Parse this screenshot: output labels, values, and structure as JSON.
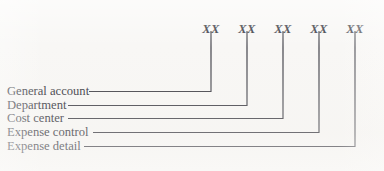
{
  "figure": {
    "kind": "account-code-structure-diagram",
    "background_color": "#f8f7f5",
    "line_color": "#3a3a42",
    "text_color": "#2f2f38",
    "width": 384,
    "height": 171
  },
  "code_blocks": [
    {
      "id": "general-account",
      "text": "XX",
      "x": 211,
      "y": 22
    },
    {
      "id": "department",
      "text": "XX",
      "x": 247,
      "y": 22
    },
    {
      "id": "cost-center",
      "text": "XX",
      "x": 283,
      "y": 22
    },
    {
      "id": "expense-control",
      "text": "XX",
      "x": 319,
      "y": 22
    },
    {
      "id": "expense-detail",
      "text": "XX",
      "x": 355,
      "y": 22
    }
  ],
  "segments": [
    {
      "id": "general-account",
      "label": "General account",
      "label_y": 85,
      "leader_start_x": 89,
      "leader_y": 91,
      "riser_x": 211,
      "riser_top_y": 31
    },
    {
      "id": "department",
      "label": "Department",
      "label_y": 99,
      "leader_start_x": 68,
      "leader_y": 105,
      "riser_x": 247,
      "riser_top_y": 31
    },
    {
      "id": "cost-center",
      "label": "Cost center",
      "label_y": 112,
      "leader_start_x": 68,
      "leader_y": 118,
      "riser_x": 283,
      "riser_top_y": 31
    },
    {
      "id": "expense-control",
      "label": "Expense control",
      "label_y": 126,
      "leader_start_x": 93,
      "leader_y": 132,
      "riser_x": 319,
      "riser_top_y": 31
    },
    {
      "id": "expense-detail",
      "label": "Expense detail",
      "label_y": 140,
      "leader_start_x": 84,
      "leader_y": 146,
      "riser_x": 355,
      "riser_top_y": 31
    }
  ]
}
